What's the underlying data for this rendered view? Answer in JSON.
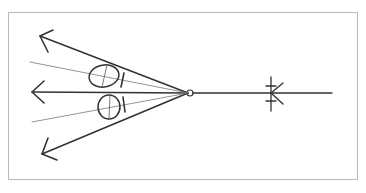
{
  "diagram": {
    "type": "ray-optics-reflection",
    "caption": "",
    "colors": {
      "stroke": "#333333",
      "thin_stroke": "#666666",
      "frame": "#b8b8b8",
      "background": "#ffffff"
    },
    "elements": {
      "focal_point": {
        "x": 190,
        "y": 93,
        "r": 3
      },
      "incoming_ray": {
        "x1": 332,
        "y1": 93,
        "x2": 193,
        "y2": 93
      },
      "incoming_arrow": {
        "tip_x": 270,
        "tip_y": 93
      },
      "tick_marker": {
        "x": 271,
        "y1": 77,
        "y2": 111
      },
      "rays_out": [
        {
          "name": "upper-ray",
          "x2": 40,
          "y2": 36
        },
        {
          "name": "middle-ray",
          "x2": 32,
          "y2": 92
        },
        {
          "name": "lower-ray",
          "x2": 42,
          "y2": 154
        }
      ],
      "thin_rays": [
        {
          "name": "upper-thin",
          "x2": 30,
          "y2": 62
        },
        {
          "name": "lower-thin",
          "x2": 32,
          "y2": 122
        }
      ],
      "ovals": [
        {
          "name": "upper-oval",
          "cx": 104,
          "cy": 76,
          "rx": 15,
          "ry": 11
        },
        {
          "name": "lower-oval",
          "cx": 109,
          "cy": 107,
          "rx": 11,
          "ry": 12
        }
      ]
    }
  }
}
